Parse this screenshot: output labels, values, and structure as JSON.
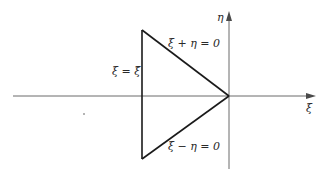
{
  "diagram": {
    "type": "region-diagram",
    "axes": {
      "horizontal": {
        "label": "ξ"
      },
      "vertical": {
        "label": "η"
      }
    },
    "region": {
      "shape": "triangle",
      "edges": [
        {
          "name": "left-edge",
          "label": "ξ = ξ̃"
        },
        {
          "name": "upper-edge",
          "label": "ξ + η = 0"
        },
        {
          "name": "lower-edge",
          "label": "ξ − η = 0"
        }
      ]
    },
    "colors": {
      "axis": "#6b6b6b",
      "triangle": "#1a1a1a",
      "text": "#2a2a2a"
    }
  }
}
